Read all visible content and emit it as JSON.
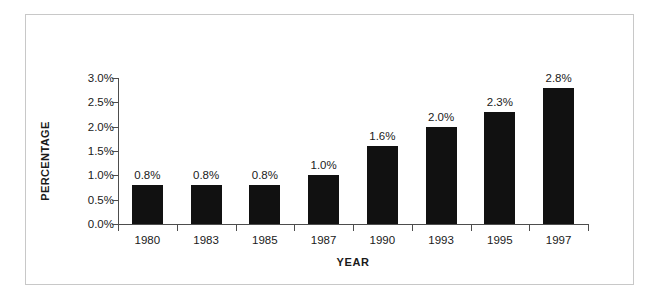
{
  "chart_data": {
    "type": "bar",
    "title": "",
    "subtitle": "",
    "xlabel": "YEAR",
    "ylabel": "PERCENTAGE",
    "categories": [
      "1980",
      "1983",
      "1985",
      "1987",
      "1990",
      "1993",
      "1995",
      "1997"
    ],
    "values": [
      0.8,
      0.8,
      0.8,
      1.0,
      1.6,
      2.0,
      2.3,
      2.8
    ],
    "value_labels": [
      "0.8%",
      "0.8%",
      "0.8%",
      "1.0%",
      "1.6%",
      "2.0%",
      "2.3%",
      "2.8%"
    ],
    "ylim": [
      0,
      3.0
    ],
    "ytick_values": [
      0,
      0.5,
      1.0,
      1.5,
      2.0,
      2.5,
      3.0
    ],
    "ytick_labels": [
      "0.0%",
      "0.5%",
      "1.0%",
      "1.5%",
      "2.0%",
      "2.5%",
      "3.0%"
    ],
    "grid": false,
    "legend": false,
    "legend_position": "none",
    "bar_color": "#111111",
    "axis_color": "#4d4d4d",
    "text_color": "#1a1a1a",
    "frame_color": "#c8c8c8",
    "background_color": "#ffffff"
  }
}
